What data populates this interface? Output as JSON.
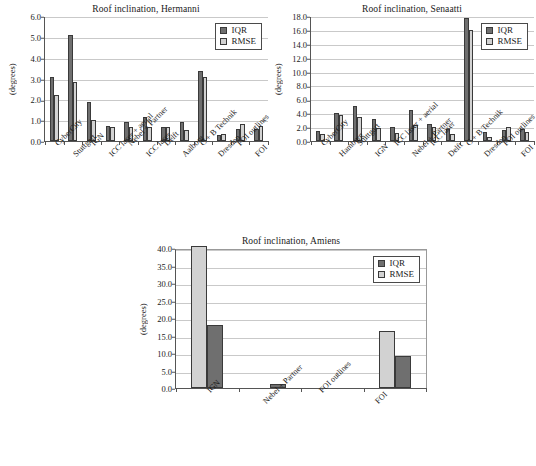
{
  "figure": {
    "panels": [
      "hermanni",
      "senaatti",
      "amiens"
    ]
  },
  "legend": {
    "iqr_label": "IQR",
    "rmse_label": "RMSE",
    "iqr_color": "#6f6f6f",
    "rmse_color": "#d2d2d2",
    "position": "top-right"
  },
  "chart_data": [
    {
      "id": "hermanni",
      "type": "bar",
      "title": "Roof inclination, Hermanni",
      "xlabel": "",
      "ylabel": "(degrees)",
      "ylim": [
        0.0,
        6.0
      ],
      "yticks": [
        "0.0",
        "1.0",
        "2.0",
        "3.0",
        "4.0",
        "5.0",
        "6.0"
      ],
      "grid": true,
      "legend": [
        "IQR",
        "RMSE"
      ],
      "bar_order": [
        "IQR",
        "RMSE"
      ],
      "categories": [
        "CyberCity",
        "Stuttgart",
        "IGN",
        "ICC laser + aerial",
        "Nebel + Partner",
        "ICC laser",
        "Delft",
        "Aalborg",
        "C + B Technik",
        "Dresden",
        "FOI outlines",
        "FOI"
      ],
      "series": [
        {
          "name": "IQR",
          "color": "#6f6f6f",
          "values": [
            3.05,
            5.1,
            1.85,
            0.72,
            0.9,
            1.17,
            0.65,
            0.9,
            3.35,
            0.3,
            0.6,
            0.57
          ]
        },
        {
          "name": "RMSE",
          "color": "#d2d2d2",
          "values": [
            2.2,
            2.85,
            1.0,
            0.67,
            0.67,
            0.67,
            0.65,
            0.55,
            3.05,
            0.33,
            0.8,
            0.7
          ]
        }
      ]
    },
    {
      "id": "senaatti",
      "type": "bar",
      "title": "Roof inclination, Senaatti",
      "xlabel": "",
      "ylabel": "(degrees)",
      "ylim": [
        0.0,
        18.0
      ],
      "yticks": [
        "0.0",
        "2.0",
        "4.0",
        "6.0",
        "8.0",
        "10.0",
        "12.0",
        "14.0",
        "16.0",
        "18.0"
      ],
      "grid": true,
      "legend": [
        "IQR",
        "RMSE"
      ],
      "bar_order": [
        "IQR",
        "RMSE"
      ],
      "categories": [
        "CyberCity",
        "Hamburg",
        "Stuttgart",
        "IGN",
        "ICC laser + aerial",
        "Nebel + Partner",
        "ICC laser",
        "Delft",
        "C + B Technik",
        "Dresden",
        "FOI outlines",
        "FOI"
      ],
      "series": [
        {
          "name": "IQR",
          "color": "#6f6f6f",
          "values": [
            1.45,
            4.0,
            5.05,
            3.2,
            2.0,
            4.5,
            2.5,
            1.75,
            17.75,
            1.25,
            1.55,
            1.75
          ]
        },
        {
          "name": "RMSE",
          "color": "#d2d2d2",
          "values": [
            0.95,
            3.7,
            3.5,
            1.85,
            1.15,
            2.25,
            1.95,
            1.0,
            16.0,
            0.6,
            2.0,
            1.35
          ]
        }
      ]
    },
    {
      "id": "amiens",
      "type": "bar",
      "title": "Roof inclination, Amiens",
      "xlabel": "",
      "ylabel": "(degrees)",
      "ylim": [
        0.0,
        40.0
      ],
      "yticks": [
        "0.0",
        "5.0",
        "10.0",
        "15.0",
        "20.0",
        "25.0",
        "30.0",
        "35.0",
        "40.0"
      ],
      "grid": true,
      "legend": [
        "IQR",
        "RMSE"
      ],
      "bar_order": [
        "RMSE",
        "IQR"
      ],
      "categories": [
        "IGN",
        "Nebel + Partner",
        "FOI outlines",
        "FOI"
      ],
      "series": [
        {
          "name": "RMSE",
          "color": "#d2d2d2",
          "values": [
            40.5,
            0.0,
            0.0,
            16.4
          ]
        },
        {
          "name": "IQR",
          "color": "#6f6f6f",
          "values": [
            17.9,
            1.2,
            0.0,
            9.2
          ]
        }
      ]
    }
  ]
}
